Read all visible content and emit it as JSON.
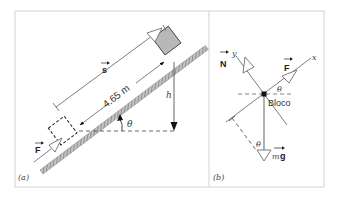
{
  "figure": {
    "panel_a": {
      "label": "(a)",
      "distance_label": "4.65 m",
      "displacement_label": "s",
      "force_label": "F",
      "height_label": "h",
      "angle_label": "θ"
    },
    "panel_b": {
      "label": "(b)",
      "normal_label": "N",
      "force_label": "F",
      "weight_label_m": "m",
      "weight_label_g": "g",
      "body_label": "Bloco",
      "x_axis_label": "x",
      "y_axis_label": "y",
      "angle_top_label": "θ",
      "angle_bottom_label": "θ"
    },
    "colors": {
      "line": "#6e6e6e",
      "dark": "#222222",
      "frame": "#cfcfcf",
      "block_fill": "#b8b8b8",
      "ground": "#9a9a9a"
    }
  }
}
